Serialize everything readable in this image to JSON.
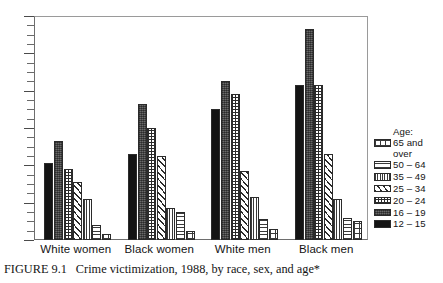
{
  "caption": {
    "figure_number": "FIGURE 9.1",
    "text": "Crime victimization, 1988, by race, sex, and age*"
  },
  "legend": {
    "title": "Age:",
    "entries": [
      {
        "label": "65 and\nover",
        "pattern": "grid",
        "key": "65 and over"
      },
      {
        "label": "50 – 64",
        "pattern": "horizontal-lines",
        "key": "50-64"
      },
      {
        "label": "35 – 49",
        "pattern": "vertical-fine-lines",
        "key": "35-49"
      },
      {
        "label": "25 – 34",
        "pattern": "diagonal-hatch",
        "key": "25-34"
      },
      {
        "label": "20 – 24",
        "pattern": "fine-dots",
        "key": "20-24"
      },
      {
        "label": "16 – 19",
        "pattern": "dark-gray-texture",
        "key": "16-19"
      },
      {
        "label": "12 – 15",
        "pattern": "solid-black",
        "key": "12-15"
      }
    ]
  },
  "chart_data": {
    "type": "bar",
    "title": "Crime victimization, 1988, by race, sex, and age*",
    "xlabel": "",
    "ylabel": "",
    "ylim": [
      0,
      120
    ],
    "ytick_labels": [
      "0",
      "20",
      "40",
      "60",
      "80",
      "100",
      "120"
    ],
    "ytick_values": [
      0,
      20,
      40,
      60,
      80,
      100,
      120
    ],
    "minor_tick_interval": 5,
    "grid": false,
    "legend_position": "right",
    "categories": [
      "White women",
      "Black women",
      "White men",
      "Black men"
    ],
    "series": [
      {
        "name": "12 – 15",
        "values": [
          41,
          46,
          70,
          83
        ]
      },
      {
        "name": "16 – 19",
        "values": [
          53,
          73,
          85,
          113
        ]
      },
      {
        "name": "20 – 24",
        "values": [
          38,
          60,
          78,
          83
        ]
      },
      {
        "name": "25 – 34",
        "values": [
          31,
          45,
          37,
          46
        ]
      },
      {
        "name": "35 – 49",
        "values": [
          22,
          17,
          23,
          22
        ]
      },
      {
        "name": "50 – 64",
        "values": [
          8,
          15,
          11,
          12
        ]
      },
      {
        "name": "65 and over",
        "values": [
          3,
          5,
          6,
          10
        ]
      }
    ]
  }
}
